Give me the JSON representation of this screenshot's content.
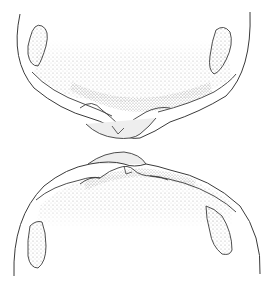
{
  "figure": {
    "colors": {
      "background": "#ffffff",
      "line": "#3a3a3a",
      "stipple": "#bdbdbd",
      "stipple_dark": "#8c8c8c"
    },
    "parts": [
      {
        "name": "upper-structure",
        "position": "top"
      },
      {
        "name": "lower-structure",
        "position": "bottom"
      }
    ]
  }
}
